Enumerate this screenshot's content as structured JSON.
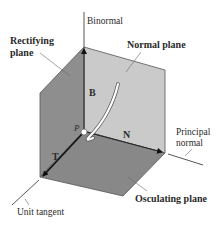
{
  "diagram": {
    "axes": {
      "binormal": {
        "label": "Binormal"
      },
      "principal_normal": {
        "label_line1": "Principal",
        "label_line2": "normal"
      },
      "unit_tangent": {
        "label": "Unit tangent"
      }
    },
    "planes": {
      "rectifying": {
        "label_line1": "Rectifying",
        "label_line2": "plane",
        "color": "#8e8e8e"
      },
      "normal": {
        "label": "Normal plane",
        "color": "#cacaca"
      },
      "osculating": {
        "label": "Osculating plane",
        "color": "#888888"
      }
    },
    "vectors": {
      "T": {
        "label": "T"
      },
      "N": {
        "label": "N"
      },
      "B": {
        "label": "B"
      }
    },
    "point": {
      "label": "P"
    },
    "colors": {
      "edge": "#555555",
      "axis": "#333333",
      "vector": "#111111",
      "curve": "#ffffff"
    }
  }
}
